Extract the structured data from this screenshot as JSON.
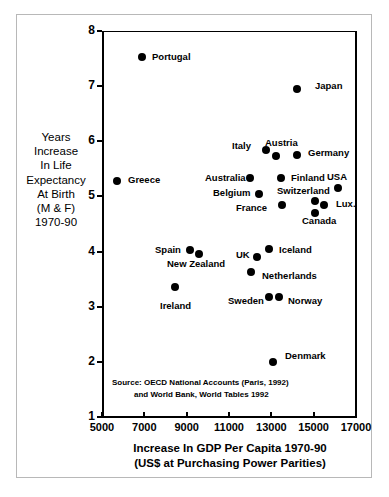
{
  "chart_data": {
    "type": "scatter",
    "title": "",
    "xlabel": "Increase In GDP Per Capita 1970-90 (US$ at Purchasing Power Parities)",
    "xlabel_line1": "Increase In GDP Per Capita 1970-90",
    "xlabel_line2": "(US$ at Purchasing Power Parities)",
    "ylabel": "Years Increase In Life Expectancy At Birth (M & F) 1970-90",
    "ylabel_lines": [
      "Years",
      "Increase",
      "In Life",
      "Expectancy",
      "At Birth",
      "(M & F)",
      "1970-90"
    ],
    "xlim": [
      5000,
      17000
    ],
    "ylim": [
      1,
      8
    ],
    "xticks": [
      5000,
      7000,
      9000,
      11000,
      13000,
      15000,
      17000
    ],
    "xtick_labels": [
      "5000",
      "7000",
      "9000",
      "11000",
      "13000",
      "15000",
      "17000"
    ],
    "yticks": [
      1,
      2,
      3,
      4,
      5,
      6,
      7,
      8
    ],
    "ytick_labels": [
      "1",
      "2",
      "3",
      "4",
      "5",
      "6",
      "7",
      "8"
    ],
    "grid": false,
    "legend": "none",
    "marker_color": "#000000",
    "points": [
      {
        "label": "Portugal",
        "x": 6900,
        "y": 7.52,
        "lx": 152,
        "ly": 52
      },
      {
        "label": "Japan",
        "x": 14200,
        "y": 6.95,
        "lx": 315,
        "ly": 81
      },
      {
        "label": "Italy",
        "x": 12750,
        "y": 5.85,
        "lx": 232,
        "ly": 141
      },
      {
        "label": "Austria",
        "x": 13200,
        "y": 5.73,
        "lx": 265,
        "ly": 138
      },
      {
        "label": "Germany",
        "x": 14200,
        "y": 5.75,
        "lx": 308,
        "ly": 148
      },
      {
        "label": "Greece",
        "x": 5700,
        "y": 5.28,
        "lx": 128,
        "ly": 175
      },
      {
        "label": "Australia",
        "x": 12000,
        "y": 5.34,
        "lx": 205,
        "ly": 173
      },
      {
        "label": "Finland",
        "x": 13450,
        "y": 5.34,
        "lx": 291,
        "ly": 173
      },
      {
        "label": "USA",
        "x": 16150,
        "y": 5.15,
        "lx": 327,
        "ly": 172
      },
      {
        "label": "Belgium",
        "x": 12400,
        "y": 5.05,
        "lx": 213,
        "ly": 188
      },
      {
        "label": "Switzerland",
        "x": 15050,
        "y": 4.92,
        "lx": 277,
        "ly": 186
      },
      {
        "label": "Lux.",
        "x": 15500,
        "y": 4.85,
        "lx": 336,
        "ly": 199
      },
      {
        "label": "France",
        "x": 13500,
        "y": 4.85,
        "lx": 236,
        "ly": 203
      },
      {
        "label": "Canada",
        "x": 15050,
        "y": 4.7,
        "lx": 302,
        "ly": 216
      },
      {
        "label": "Spain",
        "x": 9150,
        "y": 4.02,
        "lx": 155,
        "ly": 245
      },
      {
        "label": "New Zealand",
        "x": 9600,
        "y": 3.95,
        "lx": 167,
        "ly": 259
      },
      {
        "label": "Iceland",
        "x": 12900,
        "y": 4.05,
        "lx": 279,
        "ly": 245
      },
      {
        "label": "UK",
        "x": 12300,
        "y": 3.9,
        "lx": 236,
        "ly": 250
      },
      {
        "label": "Netherlands",
        "x": 12050,
        "y": 3.63,
        "lx": 262,
        "ly": 271
      },
      {
        "label": "Ireland",
        "x": 8450,
        "y": 3.35,
        "lx": 160,
        "ly": 301
      },
      {
        "label": "Sweden",
        "x": 12900,
        "y": 3.18,
        "lx": 228,
        "ly": 296
      },
      {
        "label": "Norway",
        "x": 13350,
        "y": 3.18,
        "lx": 288,
        "ly": 296
      },
      {
        "label": "Denmark",
        "x": 13100,
        "y": 2.0,
        "lx": 285,
        "ly": 351
      }
    ],
    "source_prefix": "Source:",
    "source_line1": " OECD National Accounts (Paris, 1992)",
    "source_line2": "and World Bank, World Tables 1992"
  }
}
